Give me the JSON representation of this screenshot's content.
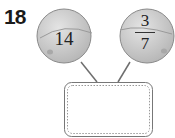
{
  "question": {
    "number": "18"
  },
  "balloons": [
    {
      "type": "whole",
      "value": "14"
    },
    {
      "type": "fraction",
      "numerator": "3",
      "denominator": "7"
    }
  ],
  "answer_box": {
    "value": ""
  },
  "colors": {
    "balloon": "#c9c9c9",
    "outline": "#8a8a8a",
    "string": "#6e6e6e"
  }
}
